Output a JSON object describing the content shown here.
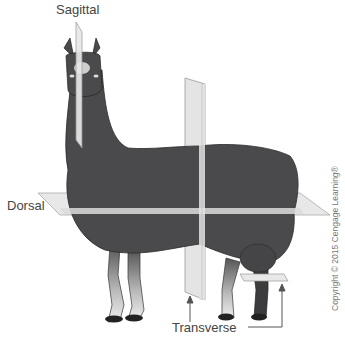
{
  "figure": {
    "labels": {
      "sagittal": "Sagittal",
      "dorsal": "Dorsal",
      "transverse": "Transverse"
    },
    "copyright": "Copyright © 2015 Cengage Learning®"
  },
  "colors": {
    "body": "#4a4a4c",
    "body_dark": "#3a3a3c",
    "plane_fill": "#e6e6e6",
    "plane_stroke": "#9a9a9a",
    "label_text": "#444444",
    "leader_line": "#555555"
  }
}
